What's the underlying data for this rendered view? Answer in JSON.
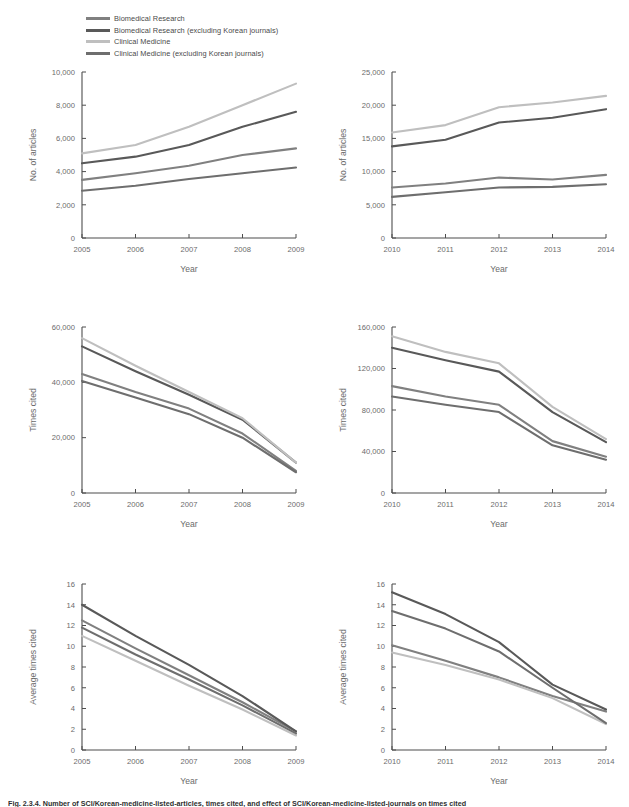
{
  "figure": {
    "caption": "Fig. 2.3.4. Number of SCI/Korean-medicine-listed-articles, times cited, and effect of SCI/Korean-medicine-listed-journals on times cited",
    "series_colors": [
      "#808080",
      "#595959",
      "#bfbfbf",
      "#6e6e6e"
    ]
  },
  "legend": {
    "items": [
      {
        "label": "Biomedical Research",
        "color": "#808080"
      },
      {
        "label": "Biomedical Research (excluding Korean journals)",
        "color": "#595959"
      },
      {
        "label": "Clinical Medicine",
        "color": "#bfbfbf"
      },
      {
        "label": "Clinical Medicine (excluding Korean journals)",
        "color": "#6e6e6e"
      }
    ]
  },
  "chart_data": [
    {
      "id": "articles-2005-2009",
      "type": "line",
      "title": "",
      "xlabel": "Year",
      "ylabel": "No. of articles",
      "categories": [
        "2005",
        "2006",
        "2007",
        "2008",
        "2009"
      ],
      "x": [
        2005,
        2006,
        2007,
        2008,
        2009
      ],
      "ylim": [
        0,
        10000
      ],
      "yticks": [
        0,
        2000,
        4000,
        6000,
        8000,
        10000
      ],
      "ytick_labels": [
        "0",
        "2,000",
        "4,000",
        "6,000",
        "8,000",
        "10,000"
      ],
      "grid": false,
      "legend_position": "top-left-external",
      "series": [
        {
          "name": "Biomedical Research",
          "color": "#808080",
          "values": [
            3500,
            3900,
            4350,
            5000,
            5400
          ]
        },
        {
          "name": "Biomedical Research (excluding Korean journals)",
          "color": "#595959",
          "values": [
            4500,
            4900,
            5600,
            6700,
            7600
          ]
        },
        {
          "name": "Clinical Medicine",
          "color": "#bfbfbf",
          "values": [
            5100,
            5600,
            6700,
            8000,
            9300
          ]
        },
        {
          "name": "Clinical Medicine (excluding Korean journals)",
          "color": "#6e6e6e",
          "values": [
            2850,
            3150,
            3550,
            3900,
            4250
          ]
        }
      ]
    },
    {
      "id": "articles-2010-2014",
      "type": "line",
      "title": "",
      "xlabel": "Year",
      "ylabel": "No. of articles",
      "categories": [
        "2010",
        "2011",
        "2012",
        "2013",
        "2014"
      ],
      "x": [
        2010,
        2011,
        2012,
        2013,
        2014
      ],
      "ylim": [
        0,
        25000
      ],
      "yticks": [
        0,
        5000,
        10000,
        15000,
        20000,
        25000
      ],
      "ytick_labels": [
        "0",
        "5,000",
        "10,000",
        "15,000",
        "20,000",
        "25,000"
      ],
      "grid": false,
      "legend_position": "none",
      "series": [
        {
          "name": "Biomedical Research",
          "color": "#808080",
          "values": [
            7600,
            8200,
            9100,
            8800,
            9500
          ]
        },
        {
          "name": "Biomedical Research (excluding Korean journals)",
          "color": "#595959",
          "values": [
            13800,
            14800,
            17400,
            18100,
            19400
          ]
        },
        {
          "name": "Clinical Medicine",
          "color": "#bfbfbf",
          "values": [
            15900,
            17000,
            19700,
            20400,
            21400
          ]
        },
        {
          "name": "Clinical Medicine (excluding Korean journals)",
          "color": "#6e6e6e",
          "values": [
            6200,
            6900,
            7600,
            7700,
            8100
          ]
        }
      ]
    },
    {
      "id": "times-cited-2005-2009",
      "type": "line",
      "title": "",
      "xlabel": "Year",
      "ylabel": "Times cited",
      "categories": [
        "2005",
        "2006",
        "2007",
        "2008",
        "2009"
      ],
      "x": [
        2005,
        2006,
        2007,
        2008,
        2009
      ],
      "ylim": [
        0,
        60000
      ],
      "yticks": [
        0,
        20000,
        40000,
        60000
      ],
      "ytick_labels": [
        "0",
        "20,000",
        "40,000",
        "60,000"
      ],
      "grid": false,
      "legend_position": "none",
      "series": [
        {
          "name": "Biomedical Research",
          "color": "#808080",
          "values": [
            43000,
            36500,
            30500,
            21500,
            8000
          ]
        },
        {
          "name": "Biomedical Research (excluding Korean journals)",
          "color": "#595959",
          "values": [
            53000,
            44000,
            35500,
            26500,
            11000
          ]
        },
        {
          "name": "Clinical Medicine",
          "color": "#bfbfbf",
          "values": [
            56000,
            46000,
            36500,
            27000,
            11000
          ]
        },
        {
          "name": "Clinical Medicine (excluding Korean journals)",
          "color": "#6e6e6e",
          "values": [
            40500,
            34500,
            28500,
            20000,
            7500
          ]
        }
      ]
    },
    {
      "id": "times-cited-2010-2014",
      "type": "line",
      "title": "",
      "xlabel": "Year",
      "ylabel": "Times cited",
      "categories": [
        "2010",
        "2011",
        "2012",
        "2013",
        "2014"
      ],
      "x": [
        2010,
        2011,
        2012,
        2013,
        2014
      ],
      "ylim": [
        0,
        160000
      ],
      "yticks": [
        0,
        40000,
        80000,
        120000,
        160000
      ],
      "ytick_labels": [
        "0",
        "40,000",
        "80,000",
        "120,000",
        "160,000"
      ],
      "grid": false,
      "legend_position": "none",
      "series": [
        {
          "name": "Biomedical Research",
          "color": "#808080",
          "values": [
            103000,
            93000,
            85000,
            50000,
            35000
          ]
        },
        {
          "name": "Biomedical Research (excluding Korean journals)",
          "color": "#595959",
          "values": [
            140000,
            128000,
            117000,
            78000,
            49000
          ]
        },
        {
          "name": "Clinical Medicine",
          "color": "#bfbfbf",
          "values": [
            151000,
            136000,
            125000,
            83000,
            52000
          ]
        },
        {
          "name": "Clinical Medicine (excluding Korean journals)",
          "color": "#6e6e6e",
          "values": [
            93000,
            85000,
            78000,
            46000,
            32000
          ]
        }
      ]
    },
    {
      "id": "avg-times-cited-2005-2009",
      "type": "line",
      "title": "",
      "xlabel": "Year",
      "ylabel": "Average times cited",
      "categories": [
        "2005",
        "2006",
        "2007",
        "2008",
        "2009"
      ],
      "x": [
        2005,
        2006,
        2007,
        2008,
        2009
      ],
      "ylim": [
        0,
        16
      ],
      "yticks": [
        0,
        2,
        4,
        6,
        8,
        10,
        12,
        14,
        16
      ],
      "ytick_labels": [
        "0",
        "2",
        "4",
        "6",
        "8",
        "10",
        "12",
        "14",
        "16"
      ],
      "grid": false,
      "legend_position": "none",
      "series": [
        {
          "name": "Biomedical Research",
          "color": "#808080",
          "values": [
            12.5,
            9.8,
            7.2,
            4.6,
            1.8
          ]
        },
        {
          "name": "Biomedical Research (excluding Korean journals)",
          "color": "#595959",
          "values": [
            14.0,
            11.0,
            8.2,
            5.2,
            1.8
          ]
        },
        {
          "name": "Clinical Medicine",
          "color": "#bfbfbf",
          "values": [
            11.0,
            8.6,
            6.2,
            3.9,
            1.4
          ]
        },
        {
          "name": "Clinical Medicine (excluding Korean journals)",
          "color": "#6e6e6e",
          "values": [
            11.8,
            9.2,
            6.8,
            4.3,
            1.6
          ]
        }
      ]
    },
    {
      "id": "avg-times-cited-2010-2014",
      "type": "line",
      "title": "",
      "xlabel": "Year",
      "ylabel": "Average times cited",
      "categories": [
        "2010",
        "2011",
        "2012",
        "2013",
        "2014"
      ],
      "x": [
        2010,
        2011,
        2012,
        2013,
        2014
      ],
      "ylim": [
        0,
        16
      ],
      "yticks": [
        0,
        2,
        4,
        6,
        8,
        10,
        12,
        14,
        16
      ],
      "ytick_labels": [
        "0",
        "2",
        "4",
        "6",
        "8",
        "10",
        "12",
        "14",
        "16"
      ],
      "grid": false,
      "legend_position": "none",
      "series": [
        {
          "name": "Biomedical Research",
          "color": "#808080",
          "values": [
            10.1,
            8.6,
            7.0,
            5.2,
            3.7
          ]
        },
        {
          "name": "Biomedical Research (excluding Korean journals)",
          "color": "#595959",
          "values": [
            15.2,
            13.1,
            10.4,
            6.3,
            3.9
          ]
        },
        {
          "name": "Clinical Medicine",
          "color": "#bfbfbf",
          "values": [
            9.4,
            8.2,
            6.8,
            5.0,
            2.5
          ]
        },
        {
          "name": "Clinical Medicine (excluding Korean journals)",
          "color": "#6e6e6e",
          "values": [
            13.4,
            11.7,
            9.5,
            6.0,
            2.6
          ]
        }
      ]
    }
  ],
  "panel_layout": [
    {
      "id": "articles-2005-2009",
      "left": 20,
      "top": 60,
      "width": 290,
      "height": 230
    },
    {
      "id": "articles-2010-2014",
      "left": 330,
      "top": 60,
      "width": 290,
      "height": 230
    },
    {
      "id": "times-cited-2005-2009",
      "left": 20,
      "top": 315,
      "width": 290,
      "height": 230
    },
    {
      "id": "times-cited-2010-2014",
      "left": 330,
      "top": 315,
      "width": 290,
      "height": 230
    },
    {
      "id": "avg-times-cited-2005-2009",
      "left": 20,
      "top": 572,
      "width": 290,
      "height": 230
    },
    {
      "id": "avg-times-cited-2010-2014",
      "left": 330,
      "top": 572,
      "width": 290,
      "height": 230
    }
  ]
}
